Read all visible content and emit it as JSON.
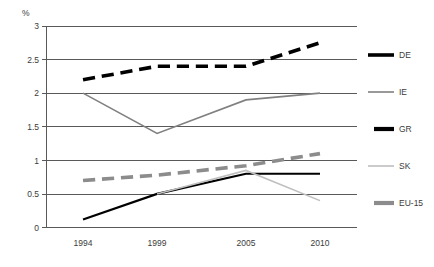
{
  "chart_data": {
    "type": "line",
    "title": "",
    "subtitle": "",
    "xlabel": "",
    "ylabel": "%",
    "unit_label": "%",
    "x": [
      1994,
      1999,
      2005,
      2010
    ],
    "categories": [
      "1994",
      "1999",
      "2005",
      "2010"
    ],
    "xtick_labels": [
      "1994",
      "1999",
      "2005",
      "2010"
    ],
    "ytick_labels": [
      "0",
      "0.5",
      "1",
      "1.5",
      "2",
      "2.5",
      "3"
    ],
    "ytick_values": [
      0,
      0.5,
      1,
      1.5,
      2,
      2.5,
      3
    ],
    "ylim": [
      0,
      3
    ],
    "xlim": [
      1991.5,
      2012.5
    ],
    "grid": "horizontal",
    "legend_position": "right",
    "series": [
      {
        "name": "DE",
        "color": "#000000",
        "style": "dashed",
        "width": 3.6,
        "x": [
          1994,
          1999,
          2005,
          2010
        ],
        "values": [
          2.2,
          2.4,
          2.4,
          2.75
        ]
      },
      {
        "name": "IE",
        "color": "#808080",
        "style": "solid",
        "width": 1.6,
        "x": [
          1994,
          1999,
          2005,
          2010
        ],
        "values": [
          2.0,
          1.4,
          1.9,
          2.0
        ]
      },
      {
        "name": "GR",
        "color": "#000000",
        "style": "solid",
        "width": 2.2,
        "x": [
          1994,
          1999,
          2005,
          2010
        ],
        "values": [
          0.12,
          0.5,
          0.8,
          0.8
        ]
      },
      {
        "name": "SK",
        "color": "#bfbfbf",
        "style": "solid",
        "width": 1.6,
        "x": [
          1999,
          2005,
          2010
        ],
        "values": [
          0.5,
          0.85,
          0.4
        ]
      },
      {
        "name": "EU-15",
        "color": "#8c8c8c",
        "style": "dashed",
        "width": 3.6,
        "x": [
          1994,
          1999,
          2005,
          2010
        ],
        "values": [
          0.7,
          0.78,
          0.92,
          1.1
        ]
      }
    ]
  },
  "axis": {
    "unit": "%",
    "y_ticks": [
      "3",
      "2.5",
      "2",
      "1.5",
      "1",
      "0.5",
      "0"
    ],
    "x_ticks": [
      "1994",
      "1999",
      "2005",
      "2010"
    ]
  },
  "legend": {
    "items": [
      {
        "label": "DE",
        "color": "#000000",
        "style": "dashed"
      },
      {
        "label": "IE",
        "color": "#808080",
        "style": "solid"
      },
      {
        "label": "GR",
        "color": "#000000",
        "style": "solid"
      },
      {
        "label": "SK",
        "color": "#bfbfbf",
        "style": "solid"
      },
      {
        "label": "EU-15",
        "color": "#8c8c8c",
        "style": "dashed"
      }
    ]
  }
}
